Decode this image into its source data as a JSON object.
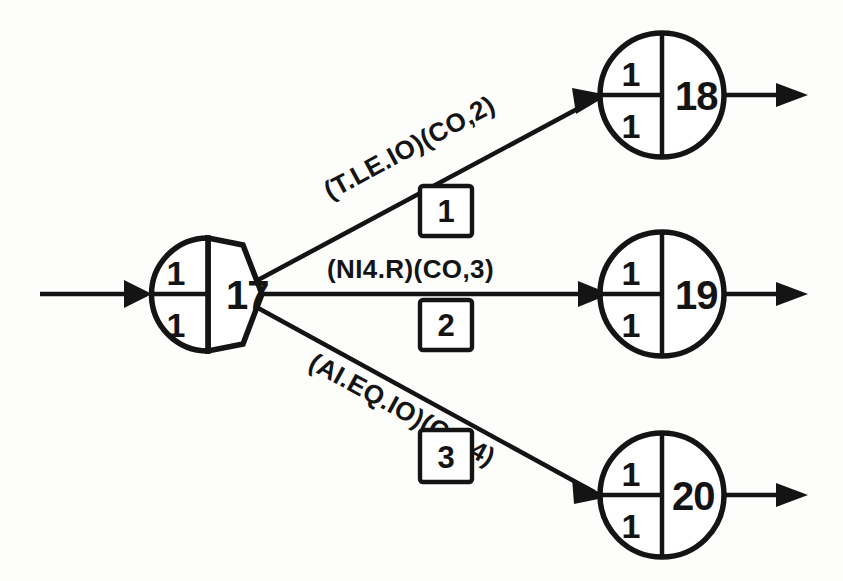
{
  "diagram": {
    "type": "flow-graph",
    "colors": {
      "ink": "#141414",
      "background": "#fdfdfc",
      "node_fill": "#ffffff"
    },
    "source_node": {
      "id": "17",
      "label": "17",
      "shape": "circle-hexagon",
      "tick_top": "1",
      "tick_bottom": "1"
    },
    "target_nodes": [
      {
        "id": "18",
        "label": "18",
        "shape": "circle",
        "tick_top": "1",
        "tick_bottom": "1"
      },
      {
        "id": "19",
        "label": "19",
        "shape": "circle",
        "tick_top": "1",
        "tick_bottom": "1"
      },
      {
        "id": "20",
        "label": "20",
        "shape": "circle",
        "tick_top": "1",
        "tick_bottom": "1"
      }
    ],
    "edges": [
      {
        "from": "17",
        "to": "18",
        "condition": "(T.LE.IO)(CO,2)",
        "box_label": "1"
      },
      {
        "from": "17",
        "to": "19",
        "condition": "(NI4.R)(CO,3)",
        "box_label": "2"
      },
      {
        "from": "17",
        "to": "20",
        "condition": "(AI.EQ.IO)(CO,4)",
        "box_label": "3"
      }
    ],
    "entry_arrow": {
      "name": "input-arrow",
      "target": "17"
    },
    "exit_arrows": [
      {
        "name": "output-arrow-18",
        "source": "18"
      },
      {
        "name": "output-arrow-19",
        "source": "19"
      },
      {
        "name": "output-arrow-20",
        "source": "20"
      }
    ]
  }
}
